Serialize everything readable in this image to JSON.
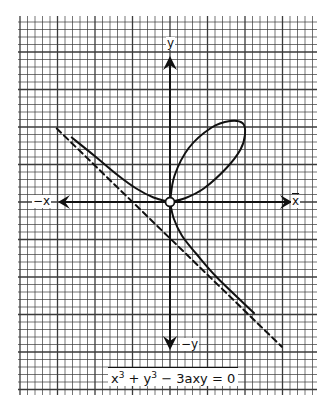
{
  "chart_data": {
    "type": "line",
    "title": "",
    "equation": {
      "lhs_parts": [
        "x",
        "3",
        " + y",
        "3",
        " − 3axy = 0"
      ],
      "text": "x³ + y³ − 3axy = 0"
    },
    "axis_labels": {
      "pos_x": "x",
      "neg_x": "−x",
      "pos_y": "y",
      "neg_y": "−y"
    },
    "grid": {
      "on": true,
      "cell_px": 7.5,
      "major_every": 5
    },
    "xlabel": "x",
    "ylabel": "y",
    "xlim": [
      -15,
      15
    ],
    "ylim": [
      -18,
      21
    ],
    "series": [
      {
        "name": "loop",
        "style": "solid",
        "points": [
          [
            0,
            0
          ],
          [
            0.6,
            3.5
          ],
          [
            2.5,
            7.2
          ],
          [
            5.5,
            9.9
          ],
          [
            8.0,
            10.8
          ],
          [
            9.7,
            10.5
          ],
          [
            10.0,
            9.0
          ],
          [
            9.4,
            7.0
          ],
          [
            7.5,
            4.5
          ],
          [
            4.5,
            1.8
          ],
          [
            2.0,
            0.5
          ],
          [
            0,
            0
          ]
        ]
      },
      {
        "name": "left-branch",
        "style": "solid",
        "points": [
          [
            -13.1,
            8.6
          ],
          [
            -10.0,
            6.1
          ],
          [
            -7.0,
            3.6
          ],
          [
            -4.5,
            1.8
          ],
          [
            -2.2,
            0.6
          ],
          [
            0,
            0
          ]
        ]
      },
      {
        "name": "lower-branch",
        "style": "solid",
        "points": [
          [
            0,
            0
          ],
          [
            0.5,
            -2.2
          ],
          [
            1.6,
            -4.5
          ],
          [
            3.5,
            -6.9
          ],
          [
            6.3,
            -10.1
          ],
          [
            11.2,
            -14.8
          ]
        ]
      },
      {
        "name": "asymptote",
        "style": "dashed",
        "equation": "x + y + a = 0",
        "points": [
          [
            -15.1,
            9.8
          ],
          [
            14.9,
            -19.3
          ]
        ]
      }
    ],
    "annotations": [
      "origin circle marker at (0,0)"
    ]
  },
  "labels": {
    "pos_x": "x",
    "neg_x": "−x",
    "pos_y": "y",
    "neg_y": "−y"
  },
  "equation": {
    "x": "x",
    "x_exp": "3",
    "plus_y": " + y",
    "y_exp": "3",
    "rest": " − 3axy = 0"
  },
  "colors": {
    "ink": "#111111",
    "grid": "#3a3a3a",
    "paper": "#ffffff"
  }
}
